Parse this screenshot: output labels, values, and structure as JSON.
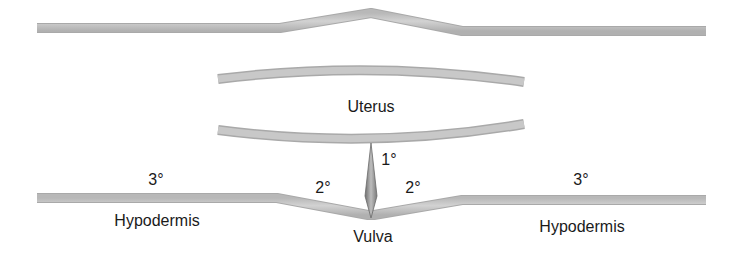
{
  "diagram": {
    "type": "anatomical schematic",
    "colors": {
      "tissue_band": "#c4c4c4",
      "tissue_band_edge": "#a8a8a8",
      "spike_fill": "#8f8f8f",
      "text": "#1a1a1a",
      "background": "#ffffff"
    },
    "labels": {
      "uterus": "Uterus",
      "vulva": "Vulva",
      "hypodermis_left": "Hypodermis",
      "hypodermis_right": "Hypodermis",
      "primary": "1°",
      "secondary_left": "2°",
      "secondary_right": "2°",
      "tertiary_left": "3°",
      "tertiary_right": "3°"
    }
  }
}
